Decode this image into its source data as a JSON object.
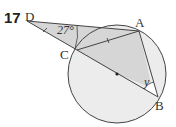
{
  "problem": {
    "number": "17"
  },
  "diagram": {
    "points": {
      "D": {
        "label": "D",
        "x": 27,
        "y": 21
      },
      "A": {
        "label": "A",
        "x": 139,
        "y": 31
      },
      "C": {
        "label": "C",
        "x": 77,
        "y": 50
      },
      "B": {
        "label": "B",
        "x": 158,
        "y": 97
      }
    },
    "circle": {
      "cx": 117,
      "cy": 74,
      "r": 49,
      "center_dot": true
    },
    "angles": {
      "D": "27°",
      "B": "y"
    },
    "colors": {
      "stroke": "#444444",
      "shade_dark": "#d4d4d4",
      "shade_light": "#ececec",
      "background": "#ffffff"
    }
  }
}
